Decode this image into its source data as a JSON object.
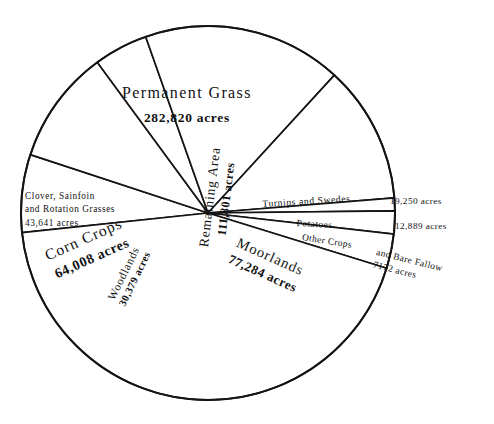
{
  "chart_data": {
    "type": "pie",
    "title": "",
    "unit": "acres",
    "total": 649244,
    "legend": "none",
    "start_angle_deg": 174,
    "direction": "clockwise",
    "categories": [
      "Clover, Sainfoin and Rotation Grasses",
      "Corn Crops",
      "Woodlands",
      "Remaining Area",
      "Moorlands",
      "Other Crops and Bare Fallow",
      "Potatoes",
      "Turnips and Swedes",
      "Permanent Grass"
    ],
    "values": [
      43641,
      64008,
      30379,
      111801,
      77284,
      7172,
      12889,
      19250,
      282820
    ],
    "slices": [
      {
        "label": "Clover, Sainfoin and Rotation Grasses",
        "value": 43641,
        "value_text": "43,641"
      },
      {
        "label": "Corn Crops",
        "value": 64008,
        "value_text": "64,008"
      },
      {
        "label": "Woodlands",
        "value": 30379,
        "value_text": "30,379"
      },
      {
        "label": "Remaining Area",
        "value": 111801,
        "value_text": "111,801"
      },
      {
        "label": "Moorlands",
        "value": 77284,
        "value_text": "77,284"
      },
      {
        "label": "Other Crops and Bare Fallow",
        "value": 7172,
        "value_text": "7172"
      },
      {
        "label": "Potatoes",
        "value": 12889,
        "value_text": "12,889"
      },
      {
        "label": "Turnips and Swedes",
        "value": 19250,
        "value_text": "19,250"
      },
      {
        "label": "Permanent Grass",
        "value": 282820,
        "value_text": "282,820"
      }
    ]
  },
  "labels": {
    "permanent_grass": {
      "name": "Permanent Grass",
      "value": "282,820 acres"
    },
    "clover": {
      "line1": "Clover,  Sainfoin",
      "line2": "and  Rotation  Grasses",
      "line3": "43,641   acres"
    },
    "corn_crops": {
      "name": "Corn Crops",
      "value": "64,008 acres"
    },
    "woodlands": {
      "name": "Woodlands",
      "value": "30,379 acres"
    },
    "remaining_area": {
      "name": "Remaining Area",
      "value": "111,801 acres"
    },
    "moorlands": {
      "name": "Moorlands",
      "value": "77,284 acres"
    },
    "turnips": {
      "name": "Turnips and  Swedes",
      "value": "19,250 acres"
    },
    "potatoes": {
      "name": "Potatoes",
      "value": "12,889  acres"
    },
    "other_crops": {
      "name": "Other Crops",
      "rest_line1": "and Bare Fallow",
      "rest_line2": "7172  acres"
    }
  },
  "style": {
    "stroke_color": "#141414",
    "fill_color": "#ffffff",
    "background": "#ffffff"
  },
  "geometry": {
    "center_x": 208,
    "center_y": 213,
    "radius": 187
  }
}
